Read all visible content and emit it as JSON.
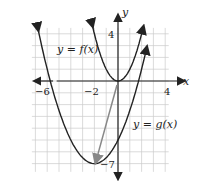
{
  "chart_data": {
    "type": "line",
    "title": "",
    "xlabel": "x",
    "ylabel": "y",
    "xlim": [
      -7.5,
      5
    ],
    "ylim": [
      -8,
      5.5
    ],
    "grid": true,
    "x_tick_labels": [
      "-6",
      "-2",
      "4"
    ],
    "y_tick_labels": [
      "4",
      "-7"
    ],
    "series": [
      {
        "name": "y = f(x)",
        "equation": "x^2",
        "vertex": [
          0,
          0
        ],
        "domain_shown": [
          -2.2,
          2.1
        ]
      },
      {
        "name": "y = g(x)",
        "equation": "0.5(x+2)^2 - 7",
        "vertex": [
          -2,
          -7
        ],
        "domain_shown": [
          -6.8,
          2.4
        ]
      }
    ],
    "annotations": [
      {
        "type": "arrow",
        "from": [
          0,
          0
        ],
        "to": [
          -2,
          -7
        ],
        "color": "#888888",
        "description": "translation arrow from vertex of f to vertex of g"
      }
    ]
  },
  "labels": {
    "x_axis": "x",
    "y_axis": "y",
    "f_label": "y = f(x)",
    "g_label": "y = g(x)",
    "tick_neg6": "−6",
    "tick_neg2": "−2",
    "tick_4x": "4",
    "tick_4y": "4",
    "tick_neg7": "−7"
  },
  "colors": {
    "curve": "#222222",
    "grid": "#cccccc",
    "axis": "#222222",
    "arrow": "#888888"
  }
}
